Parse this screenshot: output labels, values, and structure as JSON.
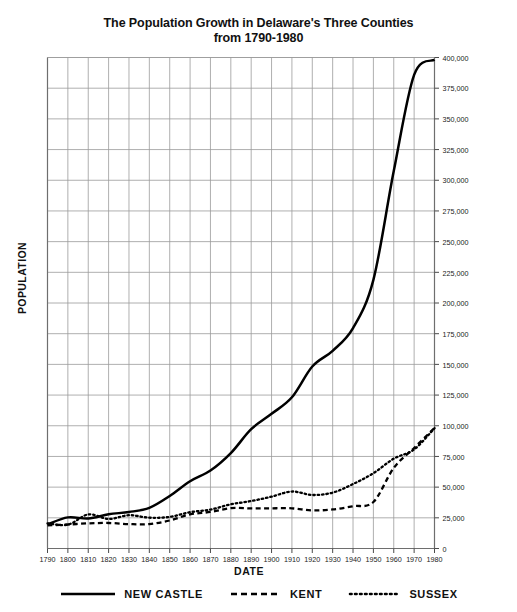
{
  "chart_data": {
    "type": "line",
    "title": "The Population Growth in Delaware's Three Counties",
    "subtitle": "from 1790-1980",
    "xlabel": "DATE",
    "ylabel": "POPULATION",
    "xlim": [
      1790,
      1980
    ],
    "ylim": [
      0,
      400000
    ],
    "grid": true,
    "legend_position": "bottom",
    "x": [
      1790,
      1800,
      1810,
      1820,
      1830,
      1840,
      1850,
      1860,
      1870,
      1880,
      1890,
      1900,
      1910,
      1920,
      1930,
      1940,
      1950,
      1960,
      1970,
      1980
    ],
    "xtick_labels": [
      "1790",
      "1800",
      "1810",
      "1820",
      "1830",
      "1840",
      "1850",
      "1860",
      "1870",
      "1880",
      "1890",
      "1900",
      "1910",
      "1920",
      "1930",
      "1940",
      "1950",
      "1960",
      "1970",
      "1980"
    ],
    "ytick_labels": [
      "0",
      "25,000",
      "50,000",
      "75,000",
      "100,000",
      "125,000",
      "150,000",
      "175,000",
      "200,000",
      "225,000",
      "250,000",
      "275,000",
      "300,000",
      "325,000",
      "350,000",
      "375,000",
      "400,000"
    ],
    "ytick_values": [
      0,
      25000,
      50000,
      75000,
      100000,
      125000,
      150000,
      175000,
      200000,
      225000,
      250000,
      275000,
      300000,
      325000,
      350000,
      375000,
      400000
    ],
    "series": [
      {
        "name": "NEW CASTLE",
        "style": "solid",
        "color": "#000000",
        "values": [
          19686,
          25361,
          24429,
          27899,
          29720,
          33120,
          42780,
          54797,
          63515,
          77716,
          97182,
          109697,
          123188,
          148239,
          161032,
          179562,
          218879,
          307446,
          385856,
          398115
        ]
      },
      {
        "name": "KENT",
        "style": "dashed",
        "color": "#000000",
        "values": [
          18920,
          19554,
          20495,
          20793,
          19913,
          19872,
          22816,
          27804,
          29804,
          32874,
          32664,
          32762,
          32721,
          31023,
          31841,
          34441,
          37870,
          65651,
          81892,
          98219
        ]
      },
      {
        "name": "SUSSEX",
        "style": "dotted",
        "color": "#000000",
        "values": [
          20488,
          19358,
          27750,
          24057,
          27115,
          25093,
          25739,
          29615,
          31696,
          36018,
          38647,
          42276,
          46413,
          43612,
          45507,
          52502,
          61336,
          73195,
          80693,
          98004
        ]
      }
    ]
  },
  "legend": {
    "items": [
      {
        "label": "NEW CASTLE",
        "style": "solid"
      },
      {
        "label": "KENT",
        "style": "dashed"
      },
      {
        "label": "SUSSEX",
        "style": "dotted"
      }
    ]
  }
}
